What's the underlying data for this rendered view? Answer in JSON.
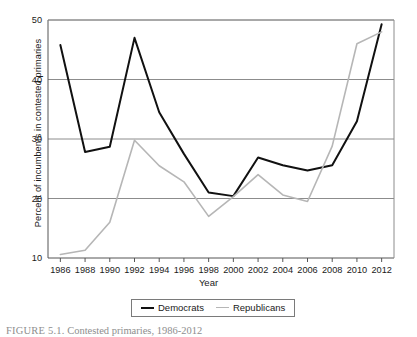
{
  "figure": {
    "caption_label": "FIGURE 5.1.",
    "caption_text": "Contested primaries, 1986-2012"
  },
  "axes": {
    "x_title": "Year",
    "y_title": "Percent of incumbents in contested primaries"
  },
  "legend": {
    "democrats_label": "Democrats",
    "republicans_label": "Republicans"
  },
  "colors": {
    "democrats": "#111111",
    "republicans": "#b6b6b6",
    "grid": "#8c8c8c",
    "axis": "#555555",
    "background": "#ffffff"
  },
  "chart_data": {
    "type": "line",
    "title": "Contested primaries, 1986-2012",
    "xlabel": "Year",
    "ylabel": "Percent of incumbents in contested primaries",
    "x": [
      1986,
      1988,
      1990,
      1992,
      1994,
      1996,
      1998,
      2000,
      2002,
      2004,
      2006,
      2008,
      2010,
      2012
    ],
    "xtick_labels": [
      "1986",
      "1988",
      "1990",
      "1992",
      "1994",
      "1996",
      "1998",
      "2000",
      "2002",
      "2004",
      "2006",
      "2008",
      "2010",
      "2012"
    ],
    "ytick_labels": [
      "10",
      "20",
      "30",
      "40",
      "50"
    ],
    "yticks": [
      10,
      20,
      30,
      40,
      50
    ],
    "xlim": [
      1985,
      2013
    ],
    "ylim": [
      10,
      50
    ],
    "grid": "horizontal",
    "legend_position": "below-axes",
    "series": [
      {
        "name": "Democrats",
        "color": "#111111",
        "values": [
          45.8,
          27.8,
          28.7,
          47.0,
          34.5,
          27.5,
          21.0,
          20.4,
          26.9,
          25.6,
          24.7,
          25.6,
          33.0,
          49.3
        ]
      },
      {
        "name": "Republicans",
        "color": "#b6b6b6",
        "values": [
          10.6,
          11.3,
          16.0,
          29.8,
          25.5,
          22.8,
          17.0,
          20.3,
          24.0,
          20.6,
          19.5,
          28.8,
          46.0,
          48.0
        ]
      }
    ]
  }
}
